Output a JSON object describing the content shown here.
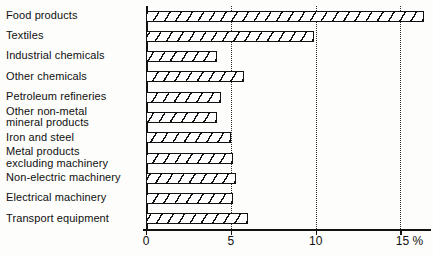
{
  "chart_data": {
    "type": "bar",
    "orientation": "horizontal",
    "title": "",
    "subtitle": "",
    "xlabel": "%",
    "ylabel": "",
    "xlim": [
      0,
      16.8
    ],
    "ylim": null,
    "grid": true,
    "legend": null,
    "legend_position": "none",
    "xticks": [
      0,
      5,
      10,
      15
    ],
    "xtick_labels": [
      "0",
      "5",
      "10",
      "15 %"
    ],
    "categories": [
      "Food products",
      "Textiles",
      "Industrial chemicals",
      "Other chemicals",
      "Petroleum refineries",
      "Other non-metal\nmineral products",
      "Iron and steel",
      "Metal products\nexcluding machinery",
      "Non-electric machinery",
      "Electrical machinery",
      "Transport equipment"
    ],
    "values": [
      16.4,
      9.9,
      4.2,
      5.8,
      4.4,
      4.2,
      5.0,
      5.1,
      5.3,
      5.1,
      6.0
    ],
    "bar_fill": "diagonal-hatch",
    "bar_color": "#111111"
  },
  "axis": {
    "unit_label": "%"
  }
}
